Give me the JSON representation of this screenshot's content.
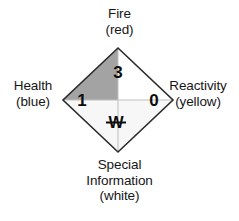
{
  "diagram": {
    "labels": {
      "fire": {
        "name": "Fire",
        "color_word": "(red)"
      },
      "health": {
        "name": "Health",
        "color_word": "(blue)"
      },
      "reactivity": {
        "name": "Reactivity",
        "color_word": "(yellow)"
      },
      "special": {
        "name_line1": "Special",
        "name_line2": "Information",
        "color_word": "(white)"
      }
    },
    "ratings": {
      "fire": "3",
      "health": "1",
      "reactivity": "0"
    },
    "special_symbol": {
      "glyph": "W",
      "meaning": "struck-through-w"
    },
    "colors": {
      "fire_quadrant": "#b4b4b4",
      "health_quadrant": "#a3a3a3",
      "reactivity_quadrant": "#ffffff",
      "special_quadrant": "#f7f7f7",
      "outline": "#2b2b2b",
      "text": "#161616",
      "background": "#ffffff"
    }
  }
}
